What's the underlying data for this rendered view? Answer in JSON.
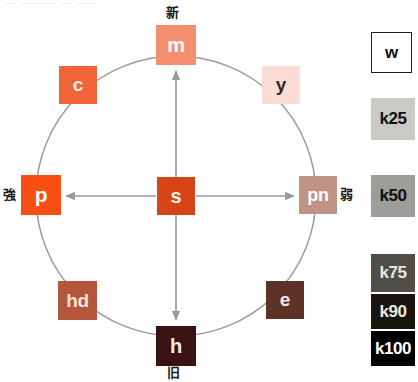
{
  "artifact": {
    "clipped_text": "— ——— — ——"
  },
  "diagram": {
    "type": "color-image-wheel",
    "center_label": "s",
    "axes": {
      "vertical": {
        "top_label": "新",
        "bottom_label": "旧",
        "arrow": "double"
      },
      "horizontal": {
        "left_label": "強",
        "right_label": "弱",
        "arrow": "double"
      }
    },
    "circle": {
      "cx": 176,
      "cy": 196,
      "r": 140,
      "stroke": "#9a9a9a"
    },
    "nodes": [
      {
        "id": "m",
        "label": "m",
        "angle_deg": 90,
        "x": 156,
        "y": 25,
        "w": 40,
        "h": 40,
        "fill": "#f49070",
        "text_color": "#ffffff",
        "font_size": 20
      },
      {
        "id": "c",
        "label": "c",
        "angle_deg": 135,
        "x": 59,
        "y": 66,
        "w": 38,
        "h": 38,
        "fill": "#f0643a",
        "text_color": "#fdf0e4",
        "font_size": 19
      },
      {
        "id": "y",
        "label": "y",
        "angle_deg": 45,
        "x": 262,
        "y": 66,
        "w": 38,
        "h": 38,
        "fill": "#fbdcd4",
        "text_color": "#2b2b2b",
        "font_size": 19
      },
      {
        "id": "p",
        "label": "p",
        "angle_deg": 180,
        "x": 21,
        "y": 175,
        "w": 40,
        "h": 40,
        "fill": "#f74f13",
        "text_color": "#ffffff",
        "font_size": 21
      },
      {
        "id": "s",
        "label": "s",
        "angle_deg": null,
        "x": 157,
        "y": 177,
        "w": 38,
        "h": 38,
        "fill": "#d64418",
        "text_color": "#fdf3e2",
        "font_size": 20
      },
      {
        "id": "pn",
        "label": "pn",
        "angle_deg": 0,
        "x": 299,
        "y": 176,
        "w": 38,
        "h": 38,
        "fill": "#c09484",
        "text_color": "#ffffff",
        "font_size": 18
      },
      {
        "id": "hd",
        "label": "hd",
        "angle_deg": 225,
        "x": 58,
        "y": 281,
        "w": 39,
        "h": 39,
        "fill": "#b3563c",
        "text_color": "#f6e2d8",
        "font_size": 19
      },
      {
        "id": "e",
        "label": "e",
        "angle_deg": 315,
        "x": 266,
        "y": 281,
        "w": 38,
        "h": 38,
        "fill": "#5f3227",
        "text_color": "#f3ebe4",
        "font_size": 19
      },
      {
        "id": "h",
        "label": "h",
        "angle_deg": 270,
        "x": 156,
        "y": 326,
        "w": 40,
        "h": 40,
        "fill": "#3a1214",
        "text_color": "#f6ece6",
        "font_size": 20
      }
    ]
  },
  "legend": {
    "title": "grayscale-key",
    "swatches": [
      {
        "id": "w",
        "label": "w",
        "fill": "#ffffff",
        "text_color": "#111111",
        "outlined": true,
        "x": 5,
        "y": 32,
        "w": 41,
        "h": 41
      },
      {
        "id": "k25",
        "label": "k25",
        "fill": "#c9c9c5",
        "text_color": "#111111",
        "outlined": false,
        "x": 5,
        "y": 98,
        "w": 44,
        "h": 42
      },
      {
        "id": "k50",
        "label": "k50",
        "fill": "#9d9d99",
        "text_color": "#111111",
        "outlined": false,
        "x": 5,
        "y": 175,
        "w": 44,
        "h": 42
      },
      {
        "id": "k75",
        "label": "k75",
        "fill": "#4f4f47",
        "text_color": "#e8e8e0",
        "outlined": false,
        "x": 5,
        "y": 254,
        "w": 44,
        "h": 38
      },
      {
        "id": "k90",
        "label": "k90",
        "fill": "#19150f",
        "text_color": "#eceae2",
        "outlined": false,
        "x": 5,
        "y": 294,
        "w": 44,
        "h": 35
      },
      {
        "id": "k100",
        "label": "k100",
        "fill": "#000000",
        "text_color": "#ffffff",
        "outlined": false,
        "x": 5,
        "y": 331,
        "w": 44,
        "h": 35
      }
    ]
  }
}
